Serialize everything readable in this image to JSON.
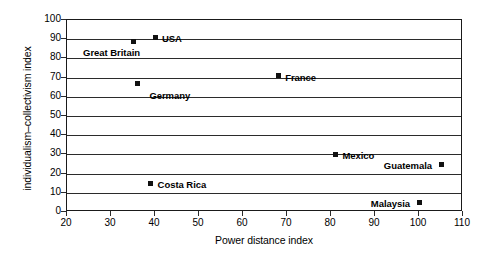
{
  "chart_data": {
    "type": "scatter",
    "title": "",
    "xlabel": "Power distance index",
    "ylabel": "individualism–collectivism index",
    "xlim": [
      20,
      110
    ],
    "ylim": [
      0,
      100
    ],
    "xticks": [
      20,
      30,
      40,
      50,
      60,
      70,
      80,
      90,
      100,
      110
    ],
    "yticks": [
      0,
      10,
      20,
      30,
      40,
      50,
      60,
      70,
      80,
      90,
      100
    ],
    "grid": "horizontal",
    "legend": "none",
    "marker_style": "filled-square",
    "marker_color": "#111111",
    "points": [
      {
        "label": "Great Britain",
        "x": 35,
        "y": 89,
        "label_position": "below-left"
      },
      {
        "label": "USA",
        "x": 40,
        "y": 91,
        "label_position": "right"
      },
      {
        "label": "Germany",
        "x": 36,
        "y": 67,
        "label_position": "below-right"
      },
      {
        "label": "France",
        "x": 68,
        "y": 71,
        "label_position": "right"
      },
      {
        "label": "Mexico",
        "x": 81,
        "y": 30,
        "label_position": "right"
      },
      {
        "label": "Guatemala",
        "x": 105,
        "y": 25,
        "label_position": "left"
      },
      {
        "label": "Costa Rica",
        "x": 39,
        "y": 15,
        "label_position": "right"
      },
      {
        "label": "Malaysia",
        "x": 100,
        "y": 5,
        "label_position": "left"
      }
    ]
  }
}
